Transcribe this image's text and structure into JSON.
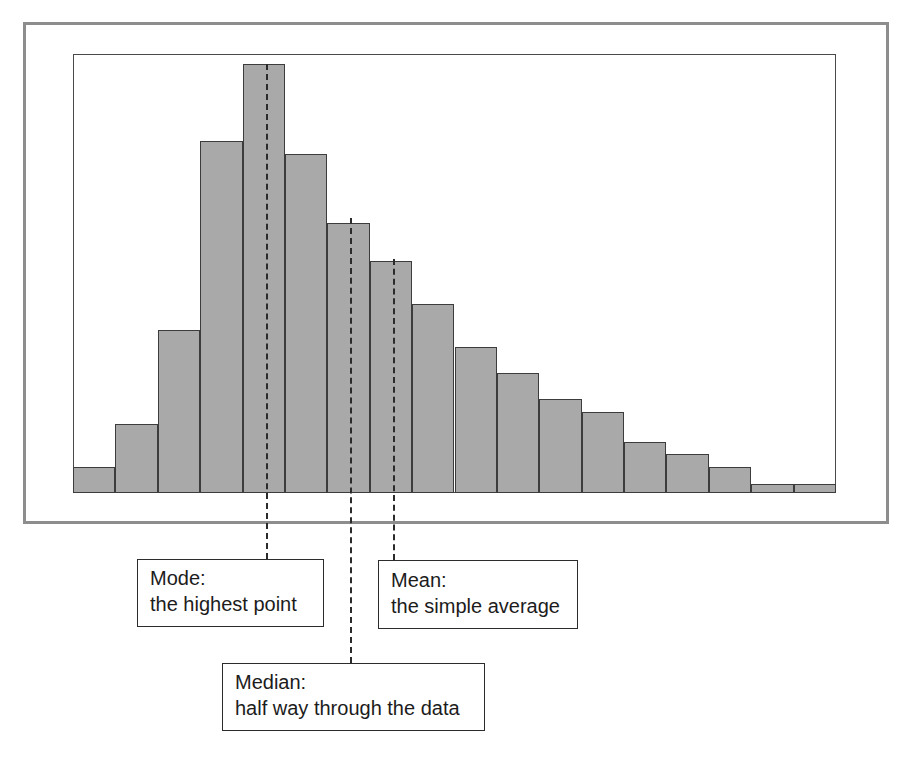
{
  "figure": {
    "kind": "histogram-with-annotations",
    "frame_color": "#8d8d8d",
    "plot_border_color": "#4a4a4a",
    "bar_fill": "#a9a9a9",
    "bar_stroke": "#3c3c3c",
    "marker_color": "#2b2b2b",
    "callout_border": "#2c2c2c",
    "callout_background": "#ffffff"
  },
  "chart_data": {
    "type": "bar",
    "title": "",
    "subtitle": "",
    "xlabel": "",
    "ylabel": "",
    "grid": false,
    "legend": "none",
    "axis_ticks_shown": false,
    "tick_labels": [],
    "xlim": [
      0,
      18
    ],
    "ylim": [
      0,
      100
    ],
    "categories": [
      "1",
      "2",
      "3",
      "4",
      "5",
      "6",
      "7",
      "8",
      "9",
      "10",
      "11",
      "12",
      "13",
      "14",
      "15",
      "16",
      "17",
      "18"
    ],
    "values": [
      6,
      16,
      38,
      82,
      100,
      79,
      63,
      54,
      44,
      34,
      28,
      22,
      19,
      12,
      9,
      6,
      2,
      2
    ],
    "series": [
      {
        "name": "frequency",
        "values": [
          6,
          16,
          38,
          82,
          100,
          79,
          63,
          54,
          44,
          34,
          28,
          22,
          19,
          12,
          9,
          6,
          2,
          2
        ]
      }
    ],
    "annotations": [
      {
        "id": "mode",
        "label": "Mode",
        "x_category": "5",
        "x_fraction": 0.2529
      },
      {
        "id": "median",
        "label": "Median",
        "x_category": "7",
        "x_fraction": 0.363
      },
      {
        "id": "mean",
        "label": "Mean",
        "x_category": "8",
        "x_fraction": 0.4194
      }
    ]
  },
  "callouts": [
    {
      "id": "mode",
      "title": "Mode:",
      "description": "the highest point"
    },
    {
      "id": "median",
      "title": "Median:",
      "description": "half way through the data"
    },
    {
      "id": "mean",
      "title": "Mean:",
      "description": "the simple average"
    }
  ]
}
